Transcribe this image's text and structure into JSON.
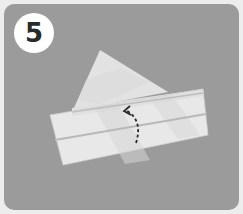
{
  "step": {
    "number": "5",
    "badge_bg": "#ffffff",
    "badge_text_color": "#2a2a2a"
  },
  "colors": {
    "outer_frame": "#ededed",
    "panel_bg": "#9b9b9b",
    "paper_light": "#e6e6e6",
    "paper_shade": "#d2d2d2",
    "crease": "#bcbcbc",
    "arrow": "#2a2a2a"
  },
  "illustration": {
    "subject": "folded paper strip with triangular flap",
    "arrow": "dashed-curved-arrow pointing up-left (fold behind)"
  }
}
